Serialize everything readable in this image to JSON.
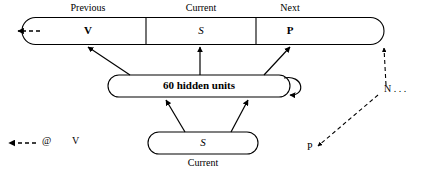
{
  "diagram": {
    "type": "recurrent-neural-network-architecture",
    "output_layer": {
      "name": "output-slot-bar",
      "cells": [
        {
          "label": "Previous",
          "value": "V"
        },
        {
          "label": "Current",
          "value": "S"
        },
        {
          "label": "Next",
          "value": "P"
        }
      ]
    },
    "hidden_layer": {
      "text": "60 hidden units",
      "recurrent_self_loop": true
    },
    "input_layer": {
      "value": "S",
      "caption": "Current"
    },
    "legend": {
      "arrow_symbol": "dashed-left-arrow",
      "at_symbol": "@",
      "item_label": "V"
    },
    "annotations": [
      {
        "name": "annotation-n",
        "text": "N . . ."
      },
      {
        "name": "annotation-p",
        "text": "P"
      }
    ],
    "colors": {
      "stroke": "#000000",
      "background": "#ffffff",
      "text": "#000000"
    }
  }
}
